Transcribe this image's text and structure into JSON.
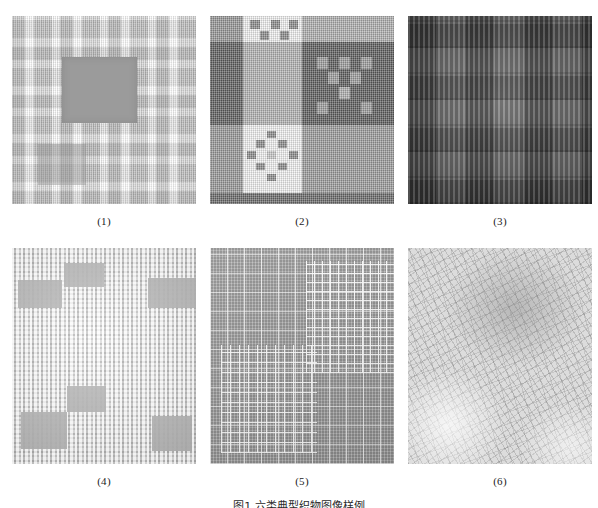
{
  "figure": {
    "caption": "图1   六类典型织物图像样例",
    "panel_label_prefix": "(",
    "panel_label_suffix": ")"
  },
  "panels": [
    {
      "id": 1,
      "label": "(1)",
      "name": "fabric-sample-1",
      "description": "light plaid weave with dark gray rectangular defect patch",
      "base_color": "#d8d8d8",
      "accent_color": "#9b9b9b"
    },
    {
      "id": 2,
      "label": "(2)",
      "name": "fabric-sample-2",
      "description": "bold checkerboard plaid with white, mid-gray and dark-gray blocks",
      "base_color": "#9a9a9a",
      "accent_color": "#ffffff"
    },
    {
      "id": 3,
      "label": "(3)",
      "name": "fabric-sample-3",
      "description": "dark fabric with vertical ribbed stripe clusters in block layout",
      "base_color": "#6e6e6e",
      "accent_color": "#c9c9c9"
    },
    {
      "id": 4,
      "label": "(4)",
      "name": "fabric-sample-4",
      "description": "pale fine plaid with scattered gray rectangular patches",
      "base_color": "#e2e2e2",
      "accent_color": "#a9a9a9"
    },
    {
      "id": 5,
      "label": "(5)",
      "name": "fabric-sample-5",
      "description": "mid-gray ground overlaid with white grid lines, denser in two regions",
      "base_color": "#a5a5a5",
      "accent_color": "#ffffff"
    },
    {
      "id": 6,
      "label": "(6)",
      "name": "fabric-sample-6",
      "description": "soft focus light fabric with diagonal crosshatch weave",
      "base_color": "#dcdcdc",
      "accent_color": "#8a8a8a"
    }
  ],
  "panel2_blocks": {
    "note": "grid block map, values are tone keys",
    "tones": {
      "d": "#5f5f5f",
      "m": "#9a9a9a",
      "w": "#f2f2f2",
      "x": "#7d7d7d"
    }
  }
}
